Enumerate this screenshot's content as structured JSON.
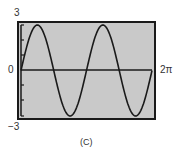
{
  "chart_data": {
    "type": "line",
    "title": "",
    "caption": "(C)",
    "function": "y = 3 sin(2x)",
    "xlabel": "",
    "ylabel": "",
    "xlim": [
      0,
      6.2832
    ],
    "ylim": [
      -3,
      3
    ],
    "x_tick_labels": [
      "0",
      "2π"
    ],
    "y_tick_labels": [
      "3",
      "0",
      "−3"
    ],
    "grid": false,
    "series": [
      {
        "name": "y = 3 sin(2x)",
        "x": [
          0,
          0.7854,
          1.5708,
          2.3562,
          3.1416,
          3.927,
          4.7124,
          5.4978,
          6.2832
        ],
        "values": [
          0,
          3,
          0,
          -3,
          0,
          3,
          0,
          -3,
          0
        ]
      }
    ],
    "colors": {
      "background": "#c9c9c9",
      "curve": "#1a1a1a",
      "frame": "#1a1a1a"
    }
  },
  "labels": {
    "y_max": "3",
    "y_min": "−3",
    "y_zero": "0",
    "x_max": "2π",
    "caption": "(C)"
  }
}
